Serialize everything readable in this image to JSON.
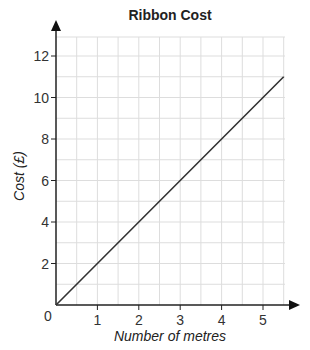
{
  "chart_data": {
    "type": "line",
    "title": "Ribbon Cost",
    "xlabel": "Number of metres",
    "ylabel": "Cost (£)",
    "x_ticks": [
      "0",
      "1",
      "2",
      "3",
      "4",
      "5"
    ],
    "y_ticks": [
      "2",
      "4",
      "6",
      "8",
      "10",
      "12"
    ],
    "xlim": [
      0,
      5.5
    ],
    "ylim": [
      0,
      13
    ],
    "grid": true,
    "series": [
      {
        "name": "Ribbon Cost",
        "x": [
          0,
          1,
          2,
          3,
          4,
          5,
          5.5
        ],
        "y": [
          0,
          2,
          4,
          6,
          8,
          10,
          11
        ]
      }
    ],
    "colors": {
      "line": "#333333",
      "grid": "#dddddd",
      "axis": "#222222"
    }
  }
}
